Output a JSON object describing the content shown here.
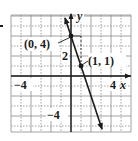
{
  "chart_data": {
    "type": "line",
    "title": "",
    "xlabel": "x",
    "ylabel": "y",
    "xlim": [
      -6,
      6
    ],
    "ylim": [
      -5.6,
      6
    ],
    "grid": true,
    "x_tick_labels": [
      {
        "value": -4,
        "label": "−4"
      },
      {
        "value": 4,
        "label": "4"
      }
    ],
    "y_tick_labels": [
      {
        "value": 2,
        "label": "2"
      },
      {
        "value": -4,
        "label": "−4"
      }
    ],
    "series": [
      {
        "name": "y = -3x + 4",
        "equation": "y = -3x + 4",
        "x": [
          -0.6,
          3.1
        ],
        "y": [
          5.8,
          -5.3
        ],
        "color": "#1a1a1a",
        "arrows": "both"
      }
    ],
    "points": [
      {
        "x": 0,
        "y": 4,
        "label": "(0, 4)"
      },
      {
        "x": 1,
        "y": 1,
        "label": "(1, 1)"
      }
    ],
    "annotations": [
      {
        "text": "(0, 4)",
        "target": [
          0,
          4
        ]
      },
      {
        "text": "(1, 1)",
        "target": [
          1,
          1
        ]
      }
    ]
  },
  "labels": {
    "x_axis": "x",
    "y_axis": "y",
    "tick_x_neg4": "−4",
    "tick_x_4": "4",
    "tick_y_2": "2",
    "tick_y_neg4": "−4",
    "point_a": "(0, 4)",
    "point_b": "(1, 1)"
  },
  "colors": {
    "ink": "#1a1a1a",
    "grid": "#8a8a8a",
    "background": "#ffffff"
  }
}
